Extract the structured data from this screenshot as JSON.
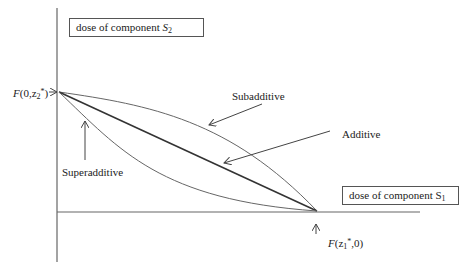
{
  "diagram": {
    "axes": {
      "y_axis_box": {
        "text": "dose of component ",
        "symbol": "S",
        "subscript": "2"
      },
      "x_axis_box": {
        "text": "dose of component S",
        "subscript": "1"
      }
    },
    "points": {
      "y_intercept": {
        "prefix": "F",
        "text_open": "(0,z",
        "subscript": "2",
        "superscript": "*",
        "text_close": ")"
      },
      "x_intercept": {
        "prefix": "F",
        "text_open": "(z",
        "subscript": "1",
        "superscript": "*",
        "text_close": ",0)"
      }
    },
    "curves": [
      {
        "name": "Subadditive",
        "label": "Subadditive",
        "shape": "concave, above additive line"
      },
      {
        "name": "Additive",
        "label": "Additive",
        "shape": "straight line"
      },
      {
        "name": "Superadditive",
        "label": "Superadditive",
        "shape": "convex, below additive line"
      }
    ],
    "colors": {
      "line": "#555555",
      "additive_line": "#333333",
      "background": "#ffffff"
    }
  }
}
